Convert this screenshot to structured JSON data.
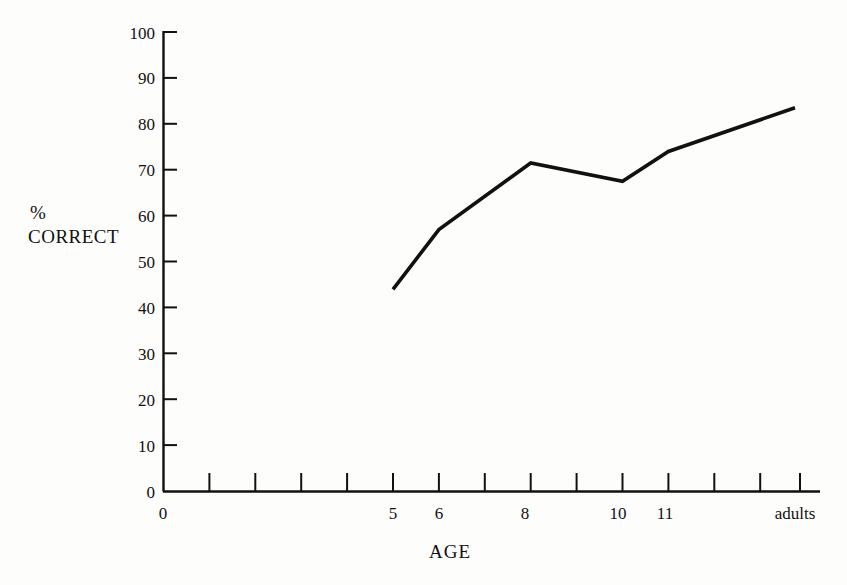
{
  "figure": {
    "background_color": "#fdfdfb",
    "line_color": "#111111",
    "axis_color": "#111111"
  },
  "chart_data": {
    "type": "line",
    "title": "",
    "subtitle": "",
    "xlabel": "AGE",
    "ylabel": "% CORRECT",
    "ylabel_lines": [
      "%",
      "CORRECT"
    ],
    "ylim": [
      0,
      100
    ],
    "ytick_values": [
      0,
      10,
      20,
      30,
      40,
      50,
      60,
      70,
      80,
      90,
      100
    ],
    "ytick_labels": [
      "0",
      "10",
      "20",
      "30",
      "40",
      "50",
      "60",
      "70",
      "80",
      "90",
      "100"
    ],
    "xtick_count": 14,
    "xtick_labels": [
      "0",
      "",
      "",
      "",
      "",
      "5",
      "6",
      "",
      "8",
      "",
      "10",
      "11",
      "",
      "adults"
    ],
    "x_origin_label": "0",
    "categories": [
      "5",
      "6",
      "8",
      "10",
      "11",
      "adults"
    ],
    "category_tick_index": [
      5,
      6,
      8,
      10,
      11,
      13
    ],
    "values": [
      44,
      57,
      71.5,
      67.5,
      74,
      83.5
    ],
    "series": [
      {
        "name": "% correct",
        "points": [
          {
            "x": "5",
            "y": 44
          },
          {
            "x": "6",
            "y": 57
          },
          {
            "x": "8",
            "y": 71.5
          },
          {
            "x": "10",
            "y": 67.5
          },
          {
            "x": "11",
            "y": 74
          },
          {
            "x": "adults",
            "y": 83.5
          }
        ]
      }
    ],
    "grid": false,
    "legend": false,
    "legend_position": "none",
    "annotations": []
  }
}
